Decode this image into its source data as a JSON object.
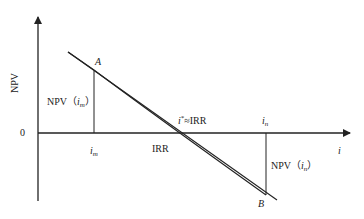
{
  "diagram": {
    "type": "irr-linear-interpolation",
    "axes": {
      "y_label": "NPV",
      "x_label": "i",
      "origin_label": "0"
    },
    "points": {
      "A": "A",
      "B": "B"
    },
    "ticks": {
      "i_m": {
        "base": "i",
        "sub": "m"
      },
      "i_n": {
        "base": "i",
        "sub": "n"
      }
    },
    "labels": {
      "irr": "IRR",
      "istar_base": "i",
      "istar_sup": "*",
      "istar_rest": "≈IRR",
      "npv_im_prefix": "NPV（",
      "npv_im_base": "i",
      "npv_im_sub": "m",
      "npv_im_suffix": "）",
      "npv_in_prefix": "NPV（",
      "npv_in_base": "i",
      "npv_in_sub": "n",
      "npv_in_suffix": "）"
    },
    "geometry": {
      "y_axis": {
        "x": 38,
        "y_top": 15,
        "y_bottom": 201
      },
      "x_axis": {
        "y": 133,
        "x_left": 38,
        "x_right": 352
      },
      "chord_line": {
        "x1": 68,
        "y1": 52,
        "x2": 276,
        "y2": 200
      },
      "curve": {
        "start": [
          68,
          52
        ],
        "A": [
          94,
          71
        ],
        "control": [
          140,
          108
        ],
        "B": [
          266,
          195
        ]
      },
      "im_drop": {
        "x": 94,
        "y_top": 71,
        "y_bottom": 133
      },
      "in_drop": {
        "x": 266,
        "y_top": 133,
        "y_bottom": 195
      },
      "irr_cross_x": 172,
      "istar_cross_x": 182
    },
    "colors": {
      "stroke": "#222222",
      "background": "#ffffff"
    }
  }
}
